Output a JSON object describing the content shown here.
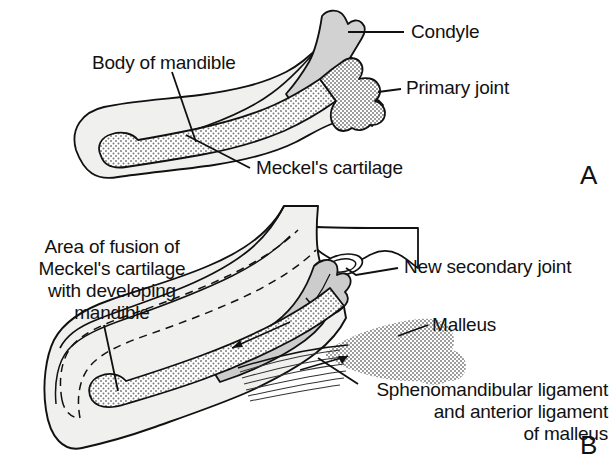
{
  "figure": {
    "background": "#ffffff",
    "width": 616,
    "height": 472
  },
  "colors": {
    "outline": "#111111",
    "bone_light": "#f0f0ee",
    "cartilage_gray": "#d2d2d2",
    "stipple_gray": "#9a9a9a",
    "text": "#111111"
  },
  "panels": [
    {
      "letter": "A",
      "caption_letter": "A",
      "labels": [
        {
          "id": "condyle",
          "text": "Condyle"
        },
        {
          "id": "primary-joint",
          "text": "Primary joint"
        },
        {
          "id": "body-of-mandible",
          "text": "Body of mandible"
        },
        {
          "id": "meckels-cartilage",
          "text": "Meckel's cartilage"
        }
      ],
      "structures": [
        {
          "id": "mandible-body",
          "name": "Body of mandible",
          "fill": "bone_light"
        },
        {
          "id": "condyle-process",
          "name": "Condyle",
          "fill": "cartilage_gray"
        },
        {
          "id": "meckels-cartilage-shape",
          "name": "Meckel's cartilage",
          "fill": "stipple"
        },
        {
          "id": "primary-joint-shape",
          "name": "Primary joint",
          "fill": "stipple"
        }
      ]
    },
    {
      "letter": "B",
      "caption_letter": "B",
      "labels": [
        {
          "id": "area-of-fusion",
          "text": "Area of fusion of\nMeckel's cartilage\nwith developing\nmandible"
        },
        {
          "id": "new-secondary-joint",
          "text": "New secondary joint"
        },
        {
          "id": "malleus",
          "text": "Malleus"
        },
        {
          "id": "sphenomandibular",
          "text": "Sphenomandibular ligament\nand anterior ligament\nof malleus"
        }
      ],
      "structures": [
        {
          "id": "mandible-body-b",
          "name": "Developing mandible",
          "fill": "bone_light"
        },
        {
          "id": "temporal-bone",
          "name": "Temporal bone",
          "fill": "bone_light"
        },
        {
          "id": "articular-disc",
          "name": "Articular disc",
          "fill": "bone_light"
        },
        {
          "id": "condyle-b",
          "name": "Condyle",
          "fill": "cartilage_gray"
        },
        {
          "id": "meckels-cartilage-b",
          "name": "Meckel's cartilage remnant",
          "fill": "stipple"
        },
        {
          "id": "malleus-shape",
          "name": "Malleus",
          "fill": "stipple"
        },
        {
          "id": "ligament-fibers",
          "name": "Sphenomandibular ligament fibers",
          "fill": "lines"
        },
        {
          "id": "fusion-dashed-outline",
          "name": "Area of fusion",
          "fill": "dashed"
        }
      ]
    }
  ],
  "label_positions": {
    "condyle": {
      "x": 411,
      "y": 23
    },
    "primary_joint": {
      "x": 406,
      "y": 79
    },
    "body_of_mandible": {
      "x": 93,
      "y": 54
    },
    "meckels_cartilage": {
      "x": 255,
      "y": 159
    },
    "panel_a_letter": {
      "x": 580,
      "y": 163
    },
    "area_of_fusion": {
      "x": 14,
      "y": 238
    },
    "new_secondary_joint": {
      "x": 404,
      "y": 258
    },
    "malleus": {
      "x": 432,
      "y": 316
    },
    "sphenomandibular": {
      "x": 352,
      "y": 392
    },
    "panel_b_letter": {
      "x": 580,
      "y": 433
    }
  }
}
